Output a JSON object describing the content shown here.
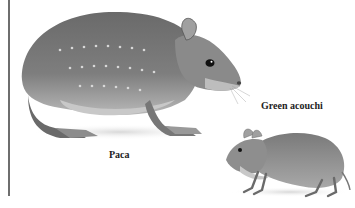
{
  "figure": {
    "labels": {
      "paca": "Paca",
      "acouchi": "Green acouchi"
    },
    "subjects": [
      {
        "name": "paca",
        "description": "large spotted rodent illustration, facing right"
      },
      {
        "name": "green-acouchi",
        "description": "small rodent illustration, facing left"
      }
    ],
    "colors": {
      "background": "#ffffff",
      "fur_dark": "#5a5a5a",
      "fur_mid": "#8a8a8a",
      "fur_light": "#c8c8c8",
      "rule": "#6e6e6e"
    }
  }
}
